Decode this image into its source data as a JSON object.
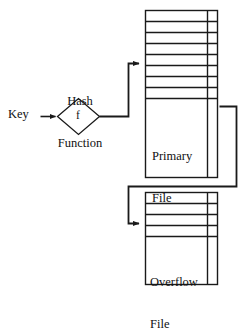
{
  "diagram": {
    "type": "flow-diagram",
    "background_color": "#ffffff",
    "line_color": "#1a1a1a",
    "text_color": "#111111",
    "nodes": {
      "key": {
        "label": "Key",
        "shape": "text",
        "x": 8,
        "y": 107
      },
      "hash_function_label": {
        "label": "Hash\nFunction",
        "line1": "Hash",
        "line2": "Function",
        "shape": "text",
        "x": 45,
        "y": 66
      },
      "hash_function_symbol": {
        "label": "f",
        "shape": "diamond",
        "cx": 78,
        "cy": 116,
        "half_width": 21,
        "half_height": 18
      },
      "primary_file": {
        "label": "Primary\nFile",
        "line1": "Primary",
        "line2": "File",
        "shape": "file-box",
        "x": 145,
        "y": 10,
        "width": 73,
        "height": 168,
        "inner_column_x": 207,
        "row_count": 8,
        "row_spacing": 11.2,
        "rows_start_y": 21
      },
      "overflow_file": {
        "label": "Overflow\nFile",
        "line1": "Overflow",
        "line2": "File",
        "shape": "file-box",
        "x": 145,
        "y": 192,
        "width": 73,
        "height": 93,
        "inner_column_x": 207,
        "row_count": 4,
        "row_spacing": 11.2,
        "rows_start_y": 203
      }
    },
    "edges": {
      "key_to_hash": {
        "name": "key-to-hash-arrow",
        "from": "key",
        "to": "hash_function_symbol",
        "style": "straight-arrow"
      },
      "hash_to_primary": {
        "name": "hash-to-primary-arrow",
        "from": "hash_function_symbol",
        "to": "primary_file",
        "style": "elbow-arrow"
      },
      "primary_to_overflow": {
        "name": "primary-to-overflow-arrow",
        "from": "primary_file",
        "to": "overflow_file",
        "style": "elbow-arrow"
      }
    }
  }
}
